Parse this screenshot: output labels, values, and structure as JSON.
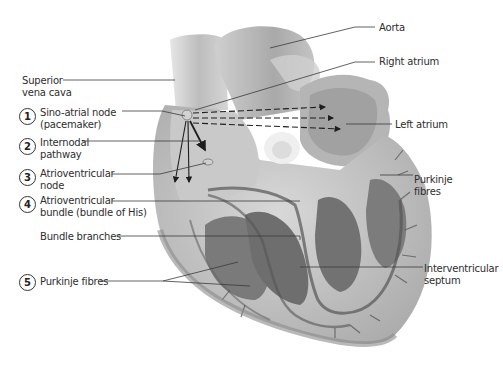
{
  "diagram": {
    "labels_left": [
      {
        "id": "superior-vena-cava",
        "number": null,
        "lines": [
          "Superior",
          "vena cava"
        ]
      },
      {
        "id": "sino-atrial-node",
        "number": "1",
        "lines": [
          "Sino-atrial node",
          "(pacemaker)"
        ]
      },
      {
        "id": "internodal-pathway",
        "number": "2",
        "lines": [
          "Internodal",
          "pathway"
        ]
      },
      {
        "id": "atrioventricular-node",
        "number": "3",
        "lines": [
          "Atrioventricular",
          "node"
        ]
      },
      {
        "id": "atrioventricular-bundle",
        "number": "4",
        "lines": [
          "Atrioventricular",
          "bundle (bundle of His)"
        ]
      },
      {
        "id": "bundle-branches",
        "number": null,
        "lines": [
          "Bundle branches"
        ]
      },
      {
        "id": "purkinje-fibres-left",
        "number": "5",
        "lines": [
          "Purkinje fibres"
        ]
      }
    ],
    "labels_right": [
      {
        "id": "aorta",
        "lines": [
          "Aorta"
        ]
      },
      {
        "id": "right-atrium",
        "lines": [
          "Right atrium"
        ]
      },
      {
        "id": "left-atrium",
        "lines": [
          "Left atrium"
        ]
      },
      {
        "id": "purkinje-fibres-right",
        "lines": [
          "Purkinje",
          "fibres"
        ]
      },
      {
        "id": "interventricular-septum",
        "lines": [
          "Interventricular",
          "septum"
        ]
      }
    ],
    "colors": {
      "tissue_light": "#d9d9d9",
      "tissue_mid": "#a8a8a8",
      "tissue_dark": "#6e6e6e",
      "line": "#3a3a3a"
    }
  }
}
